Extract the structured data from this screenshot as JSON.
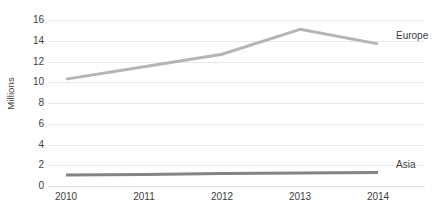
{
  "chart_data": {
    "type": "line",
    "title": "",
    "subtitle": "",
    "xlabel": "",
    "ylabel": "Millions",
    "categories": [
      "2010",
      "2011",
      "2012",
      "2013",
      "2014"
    ],
    "x": [
      2010,
      2011,
      2012,
      2013,
      2014
    ],
    "xlim": [
      2010,
      2014
    ],
    "ylim": [
      0,
      16
    ],
    "yticks": [
      0,
      2,
      4,
      6,
      8,
      10,
      12,
      14,
      16
    ],
    "ytick_labels": [
      "0",
      "2",
      "4",
      "6",
      "8",
      "10",
      "12",
      "14",
      "16"
    ],
    "grid": "horizontal",
    "legend_position": "end-of-line-labels",
    "series": [
      {
        "name": "Europe",
        "values": [
          10.3,
          11.5,
          12.7,
          15.1,
          13.7
        ],
        "color": "#b5b5b5",
        "label_text": "Europe"
      },
      {
        "name": "Asia",
        "values": [
          1.05,
          1.1,
          1.2,
          1.25,
          1.3
        ],
        "color": "#848484",
        "label_text": "Asia"
      }
    ],
    "annotations": []
  },
  "colors": {
    "background": "#ffffff",
    "gridline": "#e8e8e8",
    "tick_text": "#3d3d3d",
    "axis_title_text": "#404040",
    "series_europe": "#b5b5b5",
    "series_asia": "#848484"
  }
}
